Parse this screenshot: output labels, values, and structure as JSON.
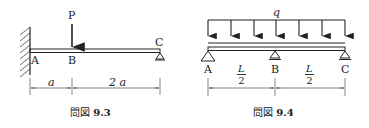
{
  "figures": [
    {
      "id": "fig-9-3",
      "caption_prefix": "問図",
      "caption_number": "9.3",
      "load_label": "P",
      "points": [
        "A",
        "B",
        "C"
      ],
      "dimensions": [
        "a",
        "2 a"
      ],
      "description": "Beam fixed at A (wall), point load P downward at B, roller support at C"
    },
    {
      "id": "fig-9-4",
      "caption_prefix": "問図",
      "caption_number": "9.4",
      "load_label": "q",
      "points": [
        "A",
        "B",
        "C"
      ],
      "dimensions": [
        {
          "numerator": "L",
          "denominator": "2"
        },
        {
          "numerator": "L",
          "denominator": "2"
        }
      ],
      "description": "Continuous beam on three supports A, B, C with uniformly distributed load q"
    }
  ],
  "colors": {
    "line": "#222222",
    "background": "#ffffff"
  }
}
